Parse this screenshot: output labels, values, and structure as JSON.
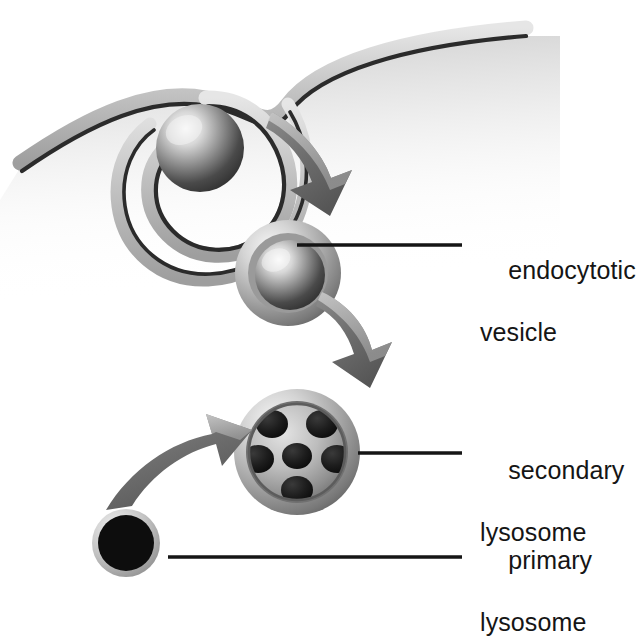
{
  "figure": {
    "type": "biological-process-diagram",
    "background_color": "#ffffff",
    "ink_color": "#151515"
  },
  "labels": [
    {
      "id": "endocytotic-vesicle",
      "line1": "endocytotic",
      "line2": "vesicle",
      "text_x": 480,
      "text_y": 224,
      "leader": {
        "x1": 297,
        "y1": 245,
        "x2": 462,
        "y2": 245
      }
    },
    {
      "id": "secondary-lysosome",
      "line1": "secondary",
      "line2": "lysosome",
      "text_x": 480,
      "text_y": 424,
      "leader": {
        "x1": 358,
        "y1": 453,
        "x2": 462,
        "y2": 453
      }
    },
    {
      "id": "primary-lysosome",
      "line1": "primary",
      "line2": "lysosome",
      "text_x": 480,
      "text_y": 514,
      "leader": {
        "x1": 168,
        "y1": 557,
        "x2": 462,
        "y2": 557
      }
    }
  ],
  "structures": {
    "cell_membrane": {
      "name": "cell membrane",
      "description": "S-shaped bilayer invaginating downward around an engulfed particle",
      "left_end": [
        20,
        168
      ],
      "right_end": [
        526,
        36
      ],
      "band_light": "#cfcfcf",
      "band_dark": "#2b2b2b"
    },
    "engulfed_particle": {
      "name": "engulfed particle",
      "cx": 200,
      "cy": 148,
      "r": 44,
      "highlight": "#f2f2f2",
      "shadow": "#2e2e2e"
    },
    "endocytotic_vesicle": {
      "name": "endocytotic vesicle",
      "cx": 288,
      "cy": 273,
      "outer_r": 53,
      "inner_r": 36,
      "membrane_light": "#dcdcdc",
      "core_dark": "#333333"
    },
    "secondary_lysosome": {
      "name": "secondary lysosome",
      "cx": 297,
      "cy": 452,
      "outer_r": 63,
      "inner_r": 48,
      "granule_count": 6,
      "granule_color": "#171717",
      "rim_light": "#e2e2e2"
    },
    "primary_lysosome": {
      "name": "primary lysosome",
      "cx": 126,
      "cy": 543,
      "outer_r": 34,
      "inner_r": 28,
      "fill": "#0d0d0d",
      "rim": "#b9b9b9"
    }
  },
  "arrows": [
    {
      "id": "arrow-membrane-to-vesicle",
      "name": "arrow from invagination to endocytotic vesicle",
      "direction": "down-right",
      "fill": "#6e6e6e"
    },
    {
      "id": "arrow-vesicle-to-lysosome",
      "name": "arrow from endocytotic vesicle to secondary lysosome",
      "direction": "down-right",
      "fill": "#6e6e6e"
    },
    {
      "id": "arrow-primary-to-secondary",
      "name": "arrow from primary lysosome to secondary lysosome",
      "direction": "up-right",
      "fill": "#6e6e6e"
    }
  ]
}
